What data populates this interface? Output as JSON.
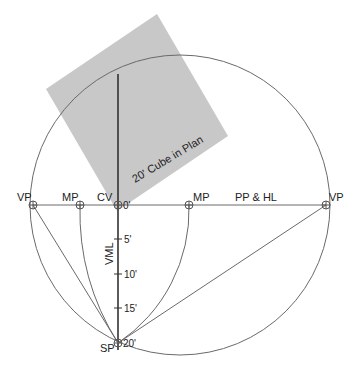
{
  "diagram": {
    "colors": {
      "cube_fill": "#c8c8c8",
      "line": "#6a6a6a",
      "vml": "#333333",
      "text": "#222222"
    },
    "cube_label": "20' Cube in Plan",
    "picture_plane_label": "PP & HL",
    "points": {
      "vp_left": "VP",
      "mp_left": "MP",
      "cv": "CV",
      "mp_right": "MP",
      "vp_right": "VP",
      "sp": "SP"
    },
    "vml_label": "VML",
    "vml_ticks": [
      "0'",
      "5'",
      "10'",
      "15'",
      "20'"
    ]
  }
}
